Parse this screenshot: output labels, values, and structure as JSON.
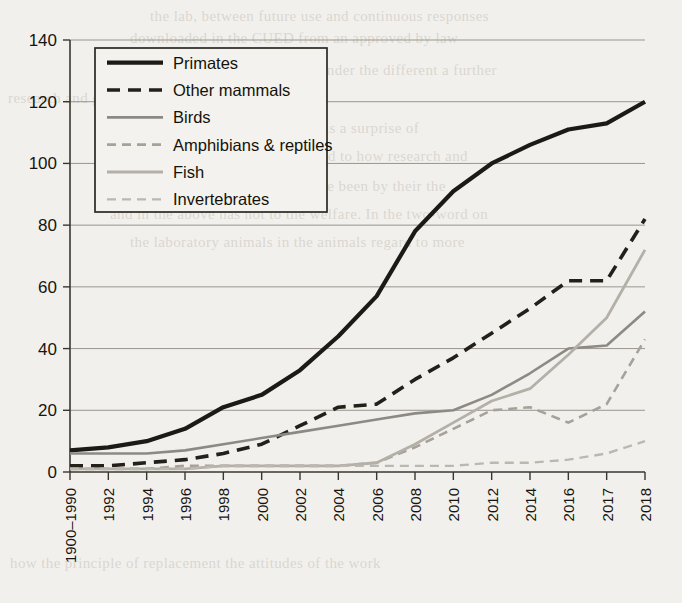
{
  "chart_data": {
    "type": "line",
    "title": "",
    "subtitle": "",
    "xlabel": "",
    "ylabel": "",
    "grid": true,
    "legend_position": "top-left",
    "ylim": [
      0,
      140
    ],
    "yticks": [
      0,
      20,
      40,
      60,
      80,
      100,
      120,
      140
    ],
    "categories": [
      "1900–1990",
      "1992",
      "1994",
      "1996",
      "1998",
      "2000",
      "2002",
      "2004",
      "2006",
      "2008",
      "2010",
      "2012",
      "2014",
      "2016",
      "2017",
      "2018"
    ],
    "series": [
      {
        "name": "Primates",
        "style": "solid",
        "color": "#1c1a16",
        "width": 4.2,
        "values": [
          7,
          8,
          10,
          14,
          21,
          25,
          33,
          44,
          57,
          78,
          91,
          100,
          106,
          111,
          113,
          120
        ]
      },
      {
        "name": "Other mammals",
        "style": "dashed",
        "color": "#232019",
        "width": 3.6,
        "values": [
          2,
          2,
          3,
          4,
          6,
          9,
          15,
          21,
          22,
          30,
          37,
          45,
          53,
          62,
          62,
          82
        ]
      },
      {
        "name": "Birds",
        "style": "solid",
        "color": "#8d8a84",
        "width": 2.6,
        "values": [
          6,
          6,
          6,
          7,
          9,
          11,
          13,
          15,
          17,
          19,
          20,
          25,
          32,
          40,
          41,
          52
        ]
      },
      {
        "name": "Amphibians & reptiles",
        "style": "dashed",
        "color": "#a6a29a",
        "width": 2.6,
        "values": [
          1,
          1,
          1,
          2,
          2,
          2,
          2,
          2,
          3,
          8,
          14,
          20,
          21,
          16,
          22,
          43
        ]
      },
      {
        "name": "Fish",
        "style": "solid",
        "color": "#b4b0a8",
        "width": 2.8,
        "values": [
          1,
          1,
          1,
          1,
          2,
          2,
          2,
          2,
          3,
          9,
          16,
          23,
          27,
          38,
          50,
          72
        ]
      },
      {
        "name": "Invertebrates",
        "style": "dashed",
        "color": "#bcb8b0",
        "width": 2.4,
        "values": [
          1,
          1,
          1,
          1,
          2,
          2,
          2,
          2,
          2,
          2,
          2,
          3,
          3,
          4,
          6,
          10
        ]
      }
    ]
  },
  "legend": {
    "items": [
      {
        "label": "Primates"
      },
      {
        "label": "Other mammals"
      },
      {
        "label": "Birds"
      },
      {
        "label": "Amphibians & reptiles"
      },
      {
        "label": "Fish"
      },
      {
        "label": "Invertebrates"
      }
    ]
  },
  "background_text": [
    {
      "text": "the lab, between future use and continuous responses",
      "x": 150,
      "y": 8
    },
    {
      "text": "downloaded in the CUED from an approved by law",
      "x": 130,
      "y": 30
    },
    {
      "text": "accessible under the different a further",
      "x": 250,
      "y": 62
    },
    {
      "text": "research and governance to the commission in",
      "x": 8,
      "y": 90
    },
    {
      "text": "a view of what we study which as a surprise of",
      "x": 120,
      "y": 120
    },
    {
      "text": "the animals being used to how research and",
      "x": 190,
      "y": 148
    },
    {
      "text": "and, that the welfare agent were been by their the",
      "x": 130,
      "y": 178
    },
    {
      "text": "and in the above has not to the welfare. In the two-word on",
      "x": 110,
      "y": 206
    },
    {
      "text": "the laboratory animals in the animals regard to more",
      "x": 130,
      "y": 234
    },
    {
      "text": "how the principle of replacement the attitudes of the work",
      "x": 10,
      "y": 555
    }
  ]
}
